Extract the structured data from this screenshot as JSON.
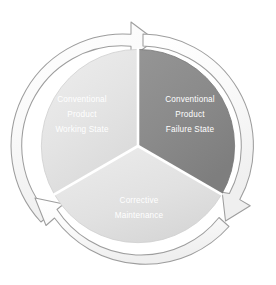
{
  "diagram": {
    "type": "cycle",
    "background_color": "#ffffff",
    "center": {
      "x": 138,
      "y": 146
    },
    "radius": 112,
    "segments": [
      {
        "id": "working-state",
        "position": "left",
        "fill_color": "#e6e6e6",
        "text_color": "#ffffff",
        "lines": [
          "Conventional",
          "Product",
          "Working State"
        ],
        "start_angle_deg": 210,
        "end_angle_deg": 330
      },
      {
        "id": "failure-state",
        "position": "right",
        "fill_color": "#8d8d8d",
        "text_color": "#ffffff",
        "lines": [
          "Conventional",
          "Product",
          "Failure State"
        ],
        "start_angle_deg": 330,
        "end_angle_deg": 90
      },
      {
        "id": "corrective-maintenance",
        "position": "bottom",
        "fill_color": "#e2e2e2",
        "text_color": "#ffffff",
        "lines": [
          "Corrective",
          "Maintenance"
        ],
        "start_angle_deg": 90,
        "end_angle_deg": 210
      }
    ],
    "arrows": [
      {
        "id": "arrow-top",
        "direction": "clockwise",
        "label": "",
        "position": "top"
      },
      {
        "id": "arrow-right",
        "direction": "clockwise",
        "label": "",
        "position": "bottom-right"
      },
      {
        "id": "arrow-left",
        "direction": "clockwise",
        "label": "",
        "position": "bottom-left"
      }
    ],
    "ring": {
      "fill_color": "#fbfbfb",
      "stroke_color": "#9a9a9a"
    }
  }
}
